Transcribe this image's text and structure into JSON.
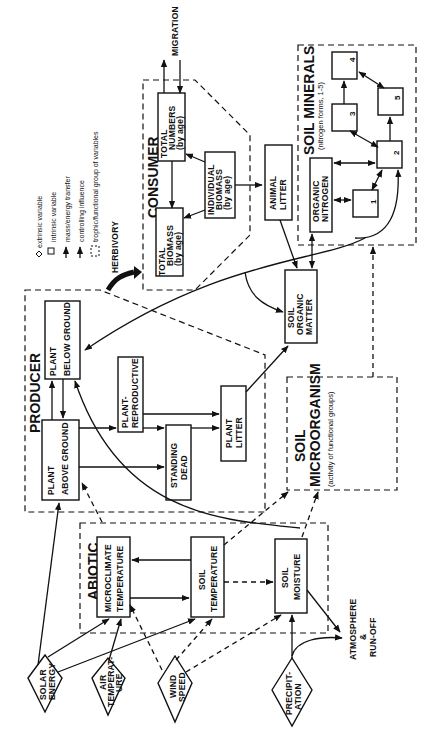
{
  "orientation": "rotated 90 degrees counter-clockwise",
  "legend": {
    "items": [
      {
        "symbol": "diamond",
        "label": "extrinsic variable"
      },
      {
        "symbol": "square",
        "label": "intrinsic variable"
      },
      {
        "symbol": "solid-arrow",
        "label": "mass/energy transfer"
      },
      {
        "symbol": "dashed-arrow",
        "label": "controlling influence"
      },
      {
        "symbol": "dashed-box",
        "label": "trophic/functional group of variables"
      }
    ]
  },
  "groups": {
    "consumer": "CONSUMER",
    "producer": "PRODUCER",
    "abiotic": "ABIOTIC",
    "soil_minerals": "SOIL MINERALS",
    "soil_minerals_sub": "(nitrogen forms, 1-5)",
    "soil_microorganism_1": "SOIL",
    "soil_microorganism_2": "MICROORGANISM",
    "soil_microorganism_sub": "(activity of functional groups)"
  },
  "nodes": {
    "total_numbers": [
      "TOTAL",
      "NUMBERS",
      "(by age)"
    ],
    "total_biomass": [
      "TOTAL",
      "BIOMASS",
      "(by age)"
    ],
    "individual_biomass": [
      "INDIVIDUAL",
      "BIOMASS",
      "(by age)"
    ],
    "animal_litter": [
      "ANIMAL",
      "LITTER"
    ],
    "organic_nitrogen": [
      "ORGANIC",
      "NITROGEN"
    ],
    "nitrogen_forms": [
      "1",
      "2",
      "3",
      "4",
      "5"
    ],
    "soil_organic_matter": [
      "SOIL",
      "ORGANIC",
      "MATTER"
    ],
    "plant_below_ground": [
      "PLANT",
      "BELOW GROUND"
    ],
    "plant_above_ground": [
      "PLANT",
      "ABOVE GROUND"
    ],
    "plant_reproductive": [
      "PLANT-",
      "REPRODUCTIVE"
    ],
    "standing_dead": [
      "STANDING",
      "DEAD"
    ],
    "plant_litter": [
      "PLANT",
      "LITTER"
    ],
    "microclimate_temperature": [
      "MICROCLIMATE",
      "TEMPERATURE"
    ],
    "soil_temperature": [
      "SOIL",
      "TEMPERATURE"
    ],
    "soil_moisture": [
      "SOIL",
      "MOISTURE"
    ]
  },
  "extrinsic": {
    "solar_energy": [
      "SOLAR",
      "ENERGY"
    ],
    "air_temperature": [
      "AIR",
      "TEMPERAT-",
      "URE"
    ],
    "wind_speed": [
      "WIND",
      "SPEED"
    ],
    "precipitation": [
      "PRECIPIT-",
      "ATION"
    ]
  },
  "labels": {
    "migration": "MIGRATION",
    "herbivory": "HERBIVORY",
    "atmosphere_1": "ATMOSPHERE",
    "atmosphere_2": "&",
    "atmosphere_3": "RUN-OFF"
  }
}
